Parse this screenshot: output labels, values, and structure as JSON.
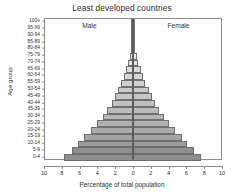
{
  "chart_data": {
    "type": "bar",
    "title": "Least developed countries",
    "xlabel": "Percentage of total population",
    "ylabel": "Age group",
    "xlim": [
      -10,
      10
    ],
    "grid": false,
    "legend_position": "in-plot-top",
    "axis_tick_labels_x": [
      "10",
      "8",
      "6",
      "4",
      "2",
      "0",
      "2",
      "4",
      "6",
      "8",
      "10"
    ],
    "axis_tick_values_x": [
      10,
      8,
      6,
      4,
      2,
      0,
      2,
      4,
      6,
      8,
      10
    ],
    "categories": [
      "0-4",
      "5-9",
      "10-14",
      "15-19",
      "20-24",
      "25-29",
      "30-34",
      "35-39",
      "40-44",
      "45-49",
      "50-54",
      "55-59",
      "60-64",
      "65-69",
      "70-74",
      "75-79",
      "80-84",
      "85-89",
      "90-94",
      "95-99",
      "100+"
    ],
    "annotations": [
      {
        "text": "Male",
        "side": "left"
      },
      {
        "text": "Female",
        "side": "right"
      }
    ],
    "series": [
      {
        "name": "Male",
        "side": "left",
        "values": [
          7.8,
          6.9,
          6.2,
          5.5,
          4.7,
          4.0,
          3.4,
          2.9,
          2.4,
          2.0,
          1.65,
          1.3,
          1.0,
          0.75,
          0.52,
          0.33,
          0.18,
          0.09,
          0.035,
          0.012,
          0.004
        ]
      },
      {
        "name": "Female",
        "side": "right",
        "values": [
          7.65,
          6.8,
          6.1,
          5.45,
          4.7,
          4.05,
          3.45,
          2.95,
          2.5,
          2.1,
          1.75,
          1.4,
          1.1,
          0.85,
          0.6,
          0.4,
          0.23,
          0.12,
          0.05,
          0.018,
          0.006
        ]
      }
    ],
    "bar_fills": [
      "#8f8f8f",
      "#8f8f8f",
      "#9a9a9a",
      "#a3a3a3",
      "#aaaaaa",
      "#b0b0b0",
      "#b5b5b5",
      "#bbbbbb",
      "#c0c0c0",
      "#c6c6c6",
      "#cbcbcb",
      "#d0d0d0",
      "#d6d6d6",
      "#dcdcdc",
      "#e2e2e2",
      "#e8e8e8",
      "#eeeeee",
      "#f3f3f3",
      "#f7f7f7",
      "#fbfbfb",
      "#ffffff"
    ]
  }
}
